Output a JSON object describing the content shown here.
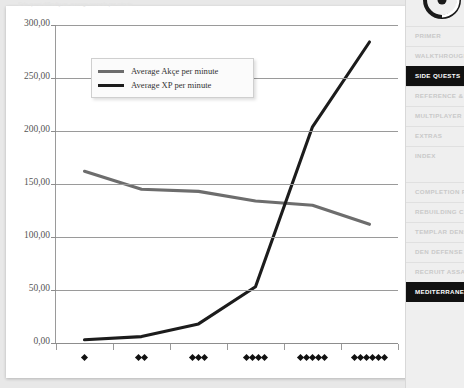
{
  "page": {
    "top_caption": "Side quest difficulty vs. average rewards per minute"
  },
  "chart_data": {
    "type": "line",
    "title": "",
    "xlabel": "",
    "ylabel": "",
    "categories": [
      "♦",
      "♦♦",
      "♦♦♦",
      "♦♦♦♦",
      "♦♦♦♦♦",
      "♦♦♦♦♦♦"
    ],
    "category_diamond_counts": [
      1,
      2,
      3,
      4,
      5,
      6
    ],
    "ylim": [
      0,
      300
    ],
    "ytick_values": [
      0,
      50,
      100,
      150,
      200,
      250,
      300
    ],
    "ytick_labels": [
      "0,00",
      "50,00",
      "100,00",
      "150,00",
      "200,00",
      "250,00",
      "300,00"
    ],
    "grid": true,
    "legend_position": "top-left-inside",
    "series": [
      {
        "name": "Average Akçe per minute",
        "color": "#6d6d6d",
        "values": [
          162,
          145,
          143,
          134,
          130,
          112
        ]
      },
      {
        "name": "Average XP per minute",
        "color": "#1c1c1c",
        "values": [
          3,
          6,
          18,
          53,
          204,
          284
        ]
      }
    ]
  },
  "legend": {
    "items": [
      {
        "label": "Average Akçe per minute",
        "color": "#6d6d6d"
      },
      {
        "label": "Average XP per minute",
        "color": "#1c1c1c"
      }
    ]
  },
  "sidebar": {
    "items": [
      {
        "label": "PRIMER",
        "active": false
      },
      {
        "label": "WALKTHROUGH",
        "active": false
      },
      {
        "label": "SIDE QUESTS",
        "active": true
      },
      {
        "label": "REFERENCE & ANALYSIS",
        "active": false
      },
      {
        "label": "MULTIPLAYER",
        "active": false
      },
      {
        "label": "EXTRAS",
        "active": false
      },
      {
        "label": "INDEX",
        "active": false
      },
      {
        "label": "COMPLETION ROADMAP",
        "active": false
      },
      {
        "label": "REBUILDING CONSTANTINOPLE",
        "active": false
      },
      {
        "label": "TEMPLAR DENS",
        "active": false
      },
      {
        "label": "DEN DEFENSE",
        "active": false
      },
      {
        "label": "RECRUIT ASSASSINS",
        "active": false
      },
      {
        "label": "MEDITERRANEAN DEFENSE",
        "active": true
      }
    ]
  }
}
